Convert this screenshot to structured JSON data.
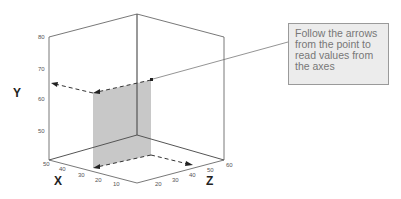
{
  "diagram": {
    "type": "3d-axes-reading-guide",
    "axes": {
      "y": {
        "label": "Y",
        "ticks": [
          "80",
          "70",
          "60",
          "50"
        ]
      },
      "x": {
        "label": "X",
        "ticks": [
          "50",
          "40",
          "30",
          "20",
          "10"
        ]
      },
      "z": {
        "label": "Z",
        "ticks": [
          "20",
          "30",
          "40",
          "50",
          "60"
        ]
      }
    },
    "callout": {
      "text": "Follow the arrows from the point to read values from the axes"
    },
    "colors": {
      "plane_fill": "#c8c8c8",
      "lines": "#444444",
      "callout_fill": "#ececec",
      "callout_text": "#777777"
    }
  }
}
